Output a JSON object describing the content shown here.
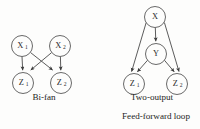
{
  "figure": {
    "background_color": "#fdfdfc",
    "node_stroke_color": "#585858",
    "edge_color": "#4a4a4a",
    "text_color": "#232323"
  },
  "diagrams": [
    {
      "id": "bi-fan",
      "caption": "Bi-fan",
      "subcaption": "",
      "nodes": [
        {
          "id": "x1",
          "base": "X",
          "sub": "1",
          "cx": 22,
          "cy": 46,
          "r": 10.5
        },
        {
          "id": "x2",
          "base": "X",
          "sub": "2",
          "cx": 60,
          "cy": 46,
          "r": 10.5
        },
        {
          "id": "z1",
          "base": "Z",
          "sub": "1",
          "cx": 23,
          "cy": 83,
          "r": 10.5
        },
        {
          "id": "z2",
          "base": "Z",
          "sub": "2",
          "cx": 61,
          "cy": 83,
          "r": 10.5
        }
      ],
      "edges": [
        {
          "from": "x1",
          "to": "z1"
        },
        {
          "from": "x1",
          "to": "z2"
        },
        {
          "from": "x2",
          "to": "z1"
        },
        {
          "from": "x2",
          "to": "z2"
        }
      ]
    },
    {
      "id": "feed-forward-loop",
      "caption": "Two-output",
      "subcaption": "Feed-forward loop",
      "nodes": [
        {
          "id": "x",
          "base": "X",
          "sub": "",
          "cx": 155,
          "cy": 17,
          "r": 10.5
        },
        {
          "id": "y",
          "base": "Y",
          "sub": "",
          "cx": 156,
          "cy": 54,
          "r": 10.5
        },
        {
          "id": "z1",
          "base": "Z",
          "sub": "1",
          "cx": 134,
          "cy": 84,
          "r": 10.5
        },
        {
          "id": "z2",
          "base": "Z",
          "sub": "2",
          "cx": 177,
          "cy": 84,
          "r": 10.5
        }
      ],
      "edges": [
        {
          "from": "x",
          "to": "y"
        },
        {
          "from": "x",
          "to": "z1"
        },
        {
          "from": "x",
          "to": "z2"
        },
        {
          "from": "y",
          "to": "z1"
        },
        {
          "from": "y",
          "to": "z2"
        }
      ]
    }
  ],
  "captions": {
    "left": "Bi-fan",
    "right_line1": "Two-output",
    "right_line2": "Feed-forward loop"
  },
  "caption_positions": {
    "left": {
      "x": 44,
      "y": 98
    },
    "right_line1": {
      "x": 152,
      "y": 98
    },
    "right_line2": {
      "x": 156,
      "y": 117
    }
  }
}
